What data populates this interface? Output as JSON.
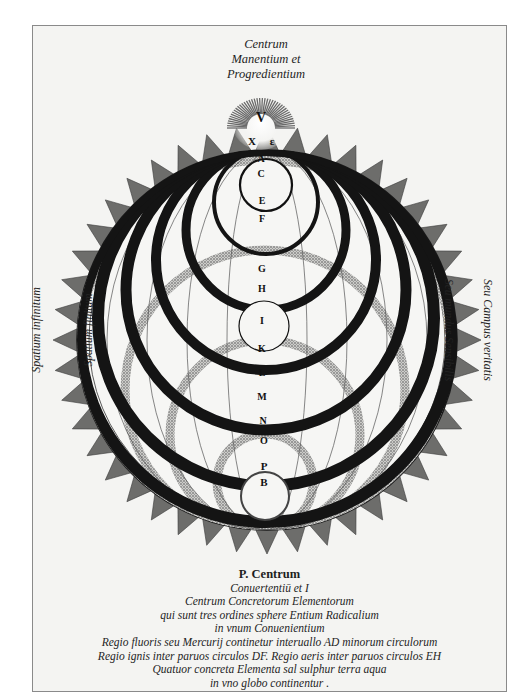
{
  "image": {
    "kind": "engraving",
    "description": "Hermetic/alchemical cosmological diagram: a large spiked circle containing nested black rings hanging from the top point and stippled rings rising from the bottom point, with a radiant sunburst at the top labelled V."
  },
  "header": {
    "lines": [
      "Centrum",
      "Manentium et",
      "Progredientium"
    ]
  },
  "side_labels": {
    "left_outer": "Spatium infinitum",
    "left_inner": "Spatium finitum",
    "right_inner": "Seu mundus Sensibilis",
    "right_outer": "Seu Campus veritatis"
  },
  "diagram_letters": {
    "sun": "V",
    "below_sun_left": "X",
    "below_sun_right": "ɛ",
    "axis": [
      "A",
      "C",
      "E",
      "F",
      "G",
      "H",
      "I",
      "K",
      "L",
      "M",
      "N",
      "O",
      "P",
      "B"
    ]
  },
  "legend": {
    "title": "P. Centrum",
    "lines": [
      "Conuertentiū et I",
      "Centrum Concretorum Elementorum",
      "qui sunt tres ordines sphere Entium Radicalium",
      "in vnum Conuenientium",
      "Regio fluoris seu Mercurij continetur interuallo AD minorum circulorum",
      "Regio ignis inter paruos circulos DF. Regio aeris inter paruos circulos EH",
      "Quatuor concreta Elementa sal sulphur terra aqua",
      "in vno globo continentur ."
    ]
  },
  "colors": {
    "paper": "#f4f4f2",
    "ink": "#141414",
    "stipple": "#8a8a8a",
    "frame": "#8a8a8a"
  }
}
